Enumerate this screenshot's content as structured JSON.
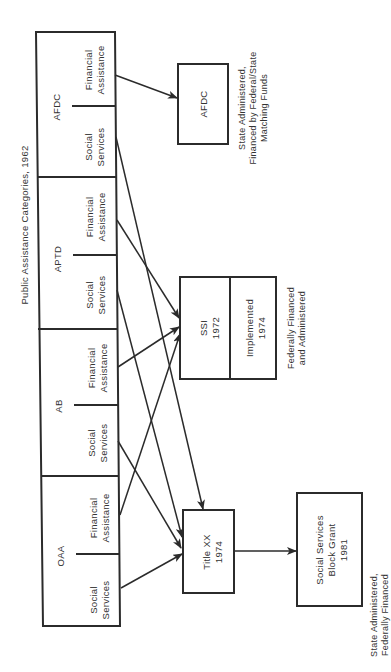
{
  "title": "Public Assistance Categories, 1962",
  "categories": [
    {
      "name": "AFDC",
      "left": "Financial Assistance",
      "right": "Social Services"
    },
    {
      "name": "APTD",
      "left": "Financial Assistance",
      "right": "Social Services"
    },
    {
      "name": "AB",
      "left": "Financial Assistance",
      "right": "Social Services"
    },
    {
      "name": "OAA",
      "left": "Financial Assistance",
      "right": "Social Services"
    }
  ],
  "labels": {
    "financial_1": "Financial",
    "financial_2": "Assistance",
    "social_1": "Social",
    "social_2": "Services"
  },
  "programs": {
    "afdc": {
      "line1": "AFDC",
      "note1": "State Administered,",
      "note2": "Financed by Federal/State",
      "note3": "Matching Funds"
    },
    "ssi": {
      "line1": "SSI",
      "line2": "1972",
      "impl1": "Implemented",
      "impl2": "1974",
      "note1": "Federally Financed",
      "note2": "and Administered"
    },
    "titlexx": {
      "line1": "Title XX",
      "line2": "1974"
    },
    "block_grant": {
      "line1": "Social Services",
      "line2": "Block Grant",
      "line3": "1981",
      "note1": "State Administered,",
      "note2": "Federally Financed"
    }
  },
  "colors": {
    "ink": "#2b2b2b",
    "background": "#ffffff"
  }
}
